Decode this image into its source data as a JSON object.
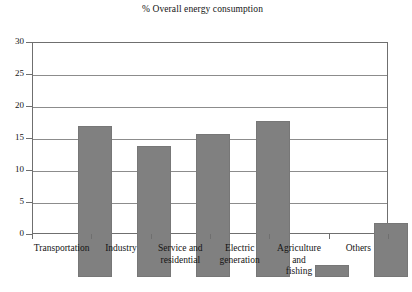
{
  "chart_data": {
    "type": "bar",
    "title": "% Overall energy consumption",
    "xlabel": "",
    "ylabel": "",
    "ylim": [
      0,
      30
    ],
    "ytick_interval": 5,
    "yticks": [
      0,
      5,
      10,
      15,
      20,
      25,
      30
    ],
    "ytick_labels": [
      "0",
      "5",
      "10",
      "15",
      "20",
      "25",
      "30"
    ],
    "grid": true,
    "grid_axis": "y",
    "legend": false,
    "legend_position": "none",
    "bar_color": "#808080",
    "plot_border_color": "#6f6f6f",
    "categories": [
      "Transportation",
      "Industry",
      "Service and residential",
      "Electric generation",
      "Agriculture and fishing",
      "Others"
    ],
    "category_label_lines": [
      [
        "Transportation"
      ],
      [
        "Industry"
      ],
      [
        "Service and",
        "residential"
      ],
      [
        "Electric",
        "generation"
      ],
      [
        "Agriculture",
        "and",
        "fishing"
      ],
      [
        "Others"
      ]
    ],
    "values": [
      23.6,
      20.5,
      22.3,
      24.4,
      1.9,
      8.4
    ]
  }
}
